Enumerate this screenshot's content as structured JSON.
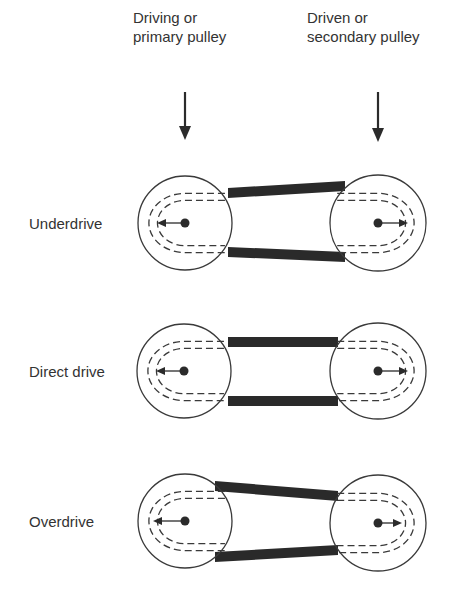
{
  "headers": {
    "left": {
      "line1": "Driving or",
      "line2": "primary pulley"
    },
    "right": {
      "line1": "Driven or",
      "line2": "secondary pulley"
    }
  },
  "rows": [
    {
      "label": "Underdrive",
      "left": {
        "cx": 185,
        "cy": 223,
        "r": 47,
        "inner": [
          38,
          29
        ],
        "arrow_len": 28
      },
      "right": {
        "cx": 378,
        "cy": 223,
        "r": 48,
        "inner": [
          38,
          29
        ],
        "arrow_len": 30
      },
      "belt": {
        "top": [
          [
            228,
            193,
            5
          ],
          [
            345,
            186,
            5
          ]
        ],
        "bot": [
          [
            228,
            252,
            5
          ],
          [
            345,
            257,
            5
          ]
        ]
      }
    },
    {
      "label": "Direct drive",
      "left": {
        "cx": 184,
        "cy": 371,
        "r": 47,
        "inner": [
          38,
          29
        ],
        "arrow_len": 28
      },
      "right": {
        "cx": 378,
        "cy": 371,
        "r": 48,
        "inner": [
          38,
          29
        ],
        "arrow_len": 30
      },
      "belt": {
        "top": [
          [
            228,
            342,
            5
          ],
          [
            338,
            342,
            5
          ]
        ],
        "bot": [
          [
            228,
            401,
            5
          ],
          [
            338,
            401,
            5
          ]
        ]
      }
    },
    {
      "label": "Overdrive",
      "left": {
        "cx": 185,
        "cy": 521,
        "r": 47,
        "inner": [
          38,
          29
        ],
        "arrow_len": 32
      },
      "right": {
        "cx": 378,
        "cy": 523,
        "r": 48,
        "inner": [
          38,
          29
        ],
        "arrow_len": 24
      },
      "belt": {
        "top": [
          [
            215,
            486,
            5
          ],
          [
            338,
            496,
            5
          ]
        ],
        "bot": [
          [
            215,
            557,
            5
          ],
          [
            338,
            550,
            5
          ]
        ]
      }
    }
  ],
  "arrows": {
    "left": {
      "x": 185,
      "y1": 92,
      "y2": 140
    },
    "right": {
      "x": 378,
      "y1": 92,
      "y2": 142
    }
  },
  "colors": {
    "ink": "#2b2b2b",
    "belt": "#2a2a2a",
    "line": "#3a3a3a"
  }
}
